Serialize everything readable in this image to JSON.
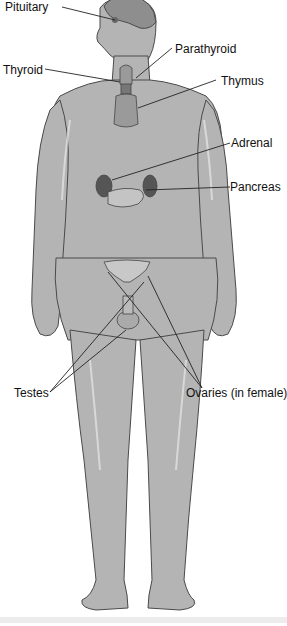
{
  "diagram": {
    "colors": {
      "body": "#b4b4b4",
      "outline": "#4a4a4a",
      "organ": "#9a9a9a",
      "label": "#111111",
      "leader": "#222222"
    },
    "labels": [
      {
        "id": "pituitary",
        "text": "Pituitary"
      },
      {
        "id": "parathyroid",
        "text": "Parathyroid"
      },
      {
        "id": "thyroid",
        "text": "Thyroid"
      },
      {
        "id": "thymus",
        "text": "Thymus"
      },
      {
        "id": "adrenal",
        "text": "Adrenal"
      },
      {
        "id": "pancreas",
        "text": "Pancreas"
      },
      {
        "id": "testes",
        "text": "Testes"
      },
      {
        "id": "ovaries",
        "text": "Ovaries (in female)"
      }
    ]
  }
}
